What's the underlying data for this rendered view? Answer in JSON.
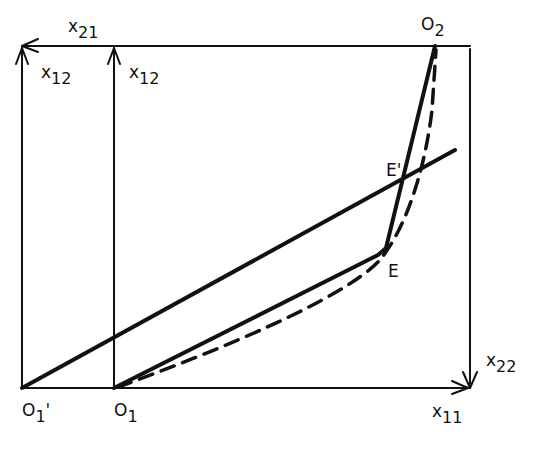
{
  "diagram": {
    "type": "edgeworth-box",
    "colors": {
      "ink": "#111111",
      "background": "#ffffff"
    },
    "labels": {
      "x21": {
        "base": "x",
        "sub": "21"
      },
      "x12_outer": {
        "base": "x",
        "sub": "12"
      },
      "x12_inner": {
        "base": "x",
        "sub": "12"
      },
      "O2": {
        "base": "O",
        "sub": "2"
      },
      "E_prime": {
        "text": "E'"
      },
      "E": {
        "text": "E"
      },
      "x22": {
        "base": "x",
        "sub": "22"
      },
      "O1_prime": {
        "base": "O",
        "sub": "1",
        "suffix": "'"
      },
      "O1": {
        "base": "O",
        "sub": "1"
      },
      "x11": {
        "base": "x",
        "sub": "11"
      }
    },
    "points": {
      "O1_prime": [
        22,
        388
      ],
      "O1": [
        114,
        388
      ],
      "O2": [
        435,
        46
      ],
      "E": [
        385,
        255
      ],
      "E_prime": [
        398,
        180
      ]
    }
  }
}
